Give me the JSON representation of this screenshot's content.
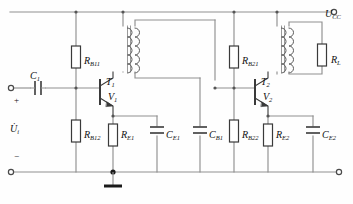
{
  "figure": {
    "type": "circuit-schematic",
    "width": 353,
    "height": 204,
    "colors": {
      "wire": "#8a8a8a",
      "component_outline": "#3a3a3a",
      "text": "#111111",
      "background": "#fefefe"
    }
  },
  "terminals": [
    {
      "id": "vcc",
      "main": "U",
      "sub": "CC",
      "x": 338,
      "y": 12,
      "label_x": 325,
      "label_y": 6
    },
    {
      "id": "input_top",
      "main": "",
      "sub": "",
      "x": 10,
      "y": 88
    },
    {
      "id": "input_bottom",
      "main": "",
      "sub": "",
      "x": 10,
      "y": 172
    },
    {
      "id": "output_right",
      "main": "",
      "sub": "",
      "x": 340,
      "y": 172
    }
  ],
  "signs": [
    {
      "id": "input-plus",
      "text": "+",
      "x": 14,
      "y": 99
    },
    {
      "id": "input-minus",
      "text": "−",
      "x": 14,
      "y": 156
    }
  ],
  "source": {
    "id": "input-voltage",
    "main": "U̇",
    "sub": "i",
    "x": 12,
    "y": 124
  },
  "components": [
    {
      "id": "c1",
      "kind": "capacitor",
      "orient": "h",
      "main": "C",
      "sub": "1",
      "label_x": 33,
      "label_y": 72
    },
    {
      "id": "rb11",
      "kind": "resistor",
      "orient": "v",
      "main": "R",
      "sub": "B11",
      "label_x": 70,
      "label_y": 48
    },
    {
      "id": "rb12",
      "kind": "resistor",
      "orient": "v",
      "main": "R",
      "sub": "B12",
      "label_x": 70,
      "label_y": 131
    },
    {
      "id": "re1",
      "kind": "resistor",
      "orient": "v",
      "main": "R",
      "sub": "E1",
      "label_x": 117,
      "label_y": 131
    },
    {
      "id": "ce1",
      "kind": "capacitor",
      "orient": "v",
      "main": "C",
      "sub": "E1",
      "label_x": 154,
      "label_y": 131
    },
    {
      "id": "cb1",
      "kind": "capacitor",
      "orient": "v",
      "main": "C",
      "sub": "B1",
      "label_x": 197,
      "label_y": 131
    },
    {
      "id": "rb21",
      "kind": "resistor",
      "orient": "v",
      "main": "R",
      "sub": "B21",
      "label_x": 228,
      "label_y": 48
    },
    {
      "id": "rb22",
      "kind": "resistor",
      "orient": "v",
      "main": "R",
      "sub": "B22",
      "label_x": 228,
      "label_y": 131
    },
    {
      "id": "re2",
      "kind": "resistor",
      "orient": "v",
      "main": "R",
      "sub": "E2",
      "label_x": 272,
      "label_y": 131
    },
    {
      "id": "ce2",
      "kind": "capacitor",
      "orient": "v",
      "main": "C",
      "sub": "E2",
      "label_x": 310,
      "label_y": 131
    },
    {
      "id": "rl",
      "kind": "resistor",
      "orient": "v",
      "main": "R",
      "sub": "L",
      "label_x": 324,
      "label_y": 48
    }
  ],
  "transistors": [
    {
      "id": "t1",
      "type_main": "T",
      "type_sub": "1",
      "type_x": 108,
      "type_y": 78,
      "name_main": "V",
      "name_sub": "1",
      "name_x": 110,
      "name_y": 93
    },
    {
      "id": "t2",
      "type_main": "T",
      "type_sub": "2",
      "type_x": 263,
      "type_y": 78,
      "name_main": "V",
      "name_sub": "2",
      "name_x": 265,
      "name_y": 93
    }
  ],
  "transformers": [
    {
      "id": "tr1",
      "x": 123,
      "y": 26,
      "height": 46,
      "role": "interstage-coupling"
    },
    {
      "id": "tr2",
      "x": 277,
      "y": 26,
      "height": 46,
      "role": "output-coupling"
    }
  ],
  "ground": {
    "id": "ground-symbol",
    "x": 105,
    "y": 172
  }
}
